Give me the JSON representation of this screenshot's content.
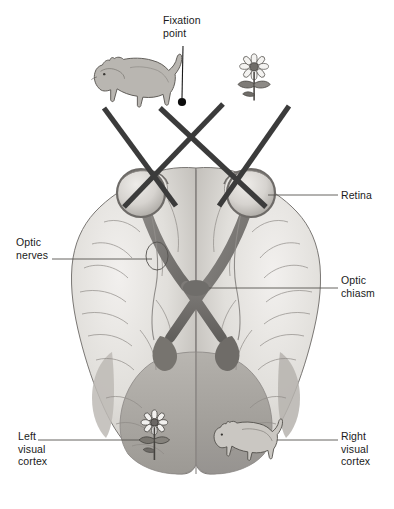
{
  "figure": {
    "width": 394,
    "height": 509,
    "background": "#ffffff"
  },
  "labels": {
    "fixation_point": "Fixation\npoint",
    "retina": "Retina",
    "optic_chiasm": "Optic\nchiasm",
    "optic_nerves": "Optic\nnerves",
    "left_visual_cortex": "Left\nvisual\ncortex",
    "right_visual_cortex": "Right\nvisual\ncortex"
  },
  "objects": {
    "cat_top": "cat-illustration",
    "flower_top": "flower-illustration",
    "cat_cortex": "cat-illustration",
    "flower_cortex": "flower-illustration",
    "fixation_dot": "fixation-point-dot"
  },
  "colors": {
    "ink": "#1a1a1a",
    "sight_line": "#3b3b3b",
    "leader_line": "#555555",
    "brain_light": "#ebe9e6",
    "brain_mid": "#cfcdc9",
    "brain_shade": "#b3b0ab",
    "cortex_shade": "#9e9b96",
    "nerve": "#7c7a77",
    "nerve_dark": "#6a6764",
    "eye_light": "#d8d6d2",
    "outline": "#6b6866"
  },
  "structures": [
    {
      "name": "left-eye",
      "label": "Retina"
    },
    {
      "name": "right-eye",
      "label": "Retina"
    },
    {
      "name": "optic-nerve-left",
      "label": "Optic nerves"
    },
    {
      "name": "optic-nerve-right",
      "label": "Optic nerves"
    },
    {
      "name": "optic-chiasm",
      "label": "Optic chiasm"
    },
    {
      "name": "optic-tract-left",
      "label": ""
    },
    {
      "name": "optic-tract-right",
      "label": ""
    },
    {
      "name": "left-visual-cortex",
      "label": "Left visual cortex"
    },
    {
      "name": "right-visual-cortex",
      "label": "Right visual cortex"
    }
  ]
}
